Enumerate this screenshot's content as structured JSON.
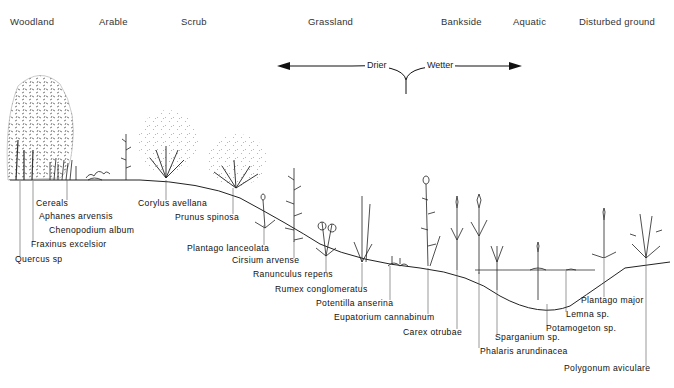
{
  "diagram": {
    "habitats": [
      {
        "label": "Woodland",
        "x": 10
      },
      {
        "label": "Arable",
        "x": 99
      },
      {
        "label": "Scrub",
        "x": 181
      },
      {
        "label": "Grassland",
        "x": 308
      },
      {
        "label": "Bankside",
        "x": 441
      },
      {
        "label": "Aquatic",
        "x": 513
      },
      {
        "label": "Disturbed ground",
        "x": 579
      }
    ],
    "moisture_gradient": {
      "left_label": "Drier",
      "right_label": "Wetter"
    },
    "species": [
      {
        "label": "Cereals",
        "x": 36,
        "y": 203
      },
      {
        "label": "Aphanes arvensis",
        "x": 39,
        "y": 216
      },
      {
        "label": "Chenopodium album",
        "x": 49,
        "y": 230
      },
      {
        "label": "Fraxinus excelsior",
        "x": 31,
        "y": 244
      },
      {
        "label": "Quercus sp",
        "x": 15,
        "y": 259
      },
      {
        "label": "Corylus avellana",
        "x": 138,
        "y": 203
      },
      {
        "label": "Prunus spinosa",
        "x": 175,
        "y": 217
      },
      {
        "label": "Plantago lanceolata",
        "x": 187,
        "y": 248
      },
      {
        "label": "Cirsium arvense",
        "x": 232,
        "y": 260
      },
      {
        "label": "Ranunculus repens",
        "x": 253,
        "y": 274
      },
      {
        "label": "Rumex conglomeratus",
        "x": 275,
        "y": 289
      },
      {
        "label": "Potentilla anserina",
        "x": 316,
        "y": 303
      },
      {
        "label": "Eupatorium cannabinum",
        "x": 334,
        "y": 317
      },
      {
        "label": "Carex otrubae",
        "x": 403,
        "y": 332
      },
      {
        "label": "Sparganium sp.",
        "x": 495,
        "y": 337
      },
      {
        "label": "Phalaris arundinacea",
        "x": 480,
        "y": 351
      },
      {
        "label": "Plantago major",
        "x": 581,
        "y": 300
      },
      {
        "label": "Lemna sp.",
        "x": 566,
        "y": 314
      },
      {
        "label": "Potamogeton sp.",
        "x": 546,
        "y": 328
      },
      {
        "label": "Polygonum aviculare",
        "x": 564,
        "y": 368
      }
    ]
  }
}
